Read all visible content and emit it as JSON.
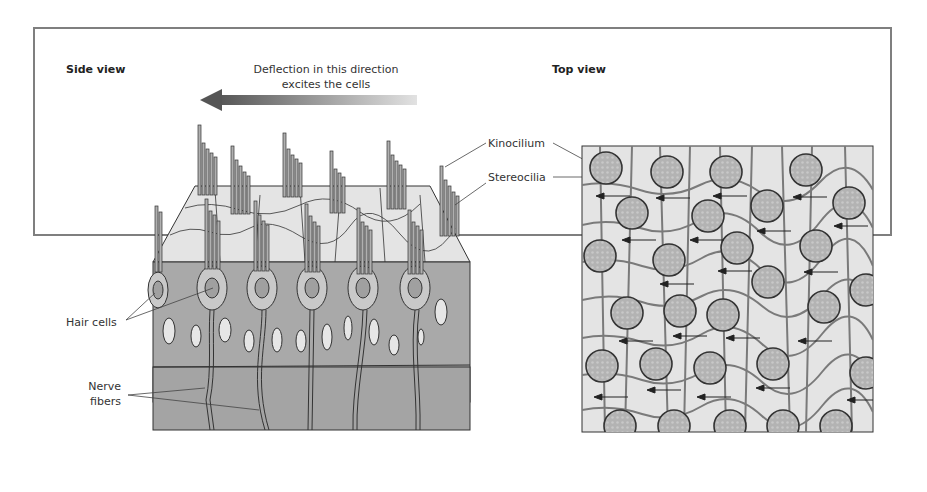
{
  "figure": {
    "side_view": {
      "title": "Side view",
      "direction_caption_line1": "Deflection in this direction",
      "direction_caption_line2": "excites the cells",
      "labels": {
        "kinocilium": "Kinocilium",
        "stereocilia": "Stereocilia",
        "hair_cells": "Hair cells",
        "nerve_fibers_line1": "Nerve",
        "nerve_fibers_line2": "fibers"
      }
    },
    "top_view": {
      "title": "Top view"
    },
    "colors": {
      "frame": "#7f7f7f",
      "tissue_dark": "#a8a8a8",
      "tissue_light": "#e4e4e4",
      "hair_cell_fill": "#b5b5b5",
      "outline": "#333333",
      "arrow_dark": "#555555",
      "arrow_light": "#dddddd"
    }
  }
}
